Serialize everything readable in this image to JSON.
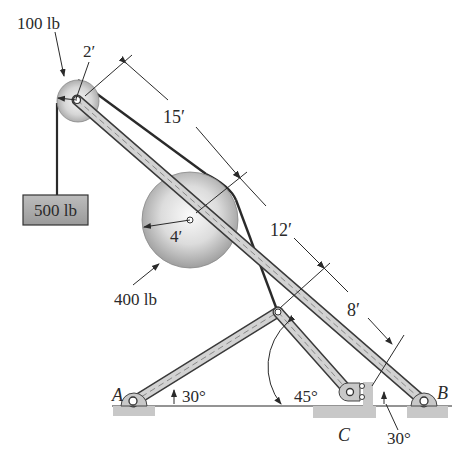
{
  "diagram": {
    "type": "statics-frame",
    "labels": {
      "small_pulley_weight": "100 lb",
      "small_pulley_radius": "2′",
      "hanging_block_weight": "500 lb",
      "large_pulley_weight": "400 lb",
      "large_pulley_radius": "4′",
      "dim_top_segment": "15′",
      "dim_mid_segment": "12′",
      "dim_low_segment": "8′",
      "angle_A": "30°",
      "angle_C_member": "45°",
      "angle_B": "30°",
      "support_A": "A",
      "support_B": "B",
      "support_C": "C"
    },
    "colors": {
      "member_fill": "#c9c9c9",
      "member_edge": "#3a3a3a",
      "cable": "#2a2a2a",
      "pulley_light": "#f4f4f4",
      "pulley_dark": "#a8a8a8",
      "ground_hatch": "#c4c4c4",
      "block_fill": "#a9a9a9"
    }
  }
}
